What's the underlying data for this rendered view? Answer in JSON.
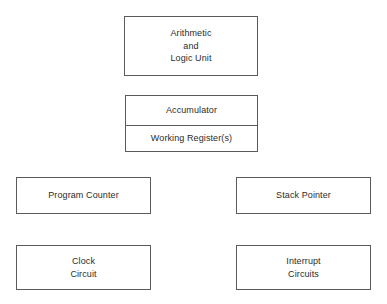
{
  "diagram": {
    "background_color": "#ffffff",
    "border_color": "#5b5b5b",
    "text_color": "#2b2b2b",
    "blocks": [
      {
        "id": "alu",
        "lines": [
          "Arithmetic",
          "and",
          "Logic Unit"
        ],
        "line1": "Arithmetic",
        "line2": "and",
        "line3": "Logic Unit"
      },
      {
        "id": "registers",
        "cells": [
          {
            "label": "Accumulator"
          },
          {
            "label": "Working Register(s)"
          }
        ],
        "accumulator": "Accumulator",
        "working_registers": "Working Register(s)"
      },
      {
        "id": "program-counter",
        "label": "Program Counter"
      },
      {
        "id": "stack-pointer",
        "label": "Stack Pointer"
      },
      {
        "id": "clock-circuit",
        "lines": [
          "Clock",
          "Circuit"
        ],
        "line1": "Clock",
        "line2": "Circuit"
      },
      {
        "id": "interrupt-circuits",
        "lines": [
          "Interrupt",
          "Circuits"
        ],
        "line1": "Interrupt",
        "line2": "Circuits"
      }
    ]
  }
}
